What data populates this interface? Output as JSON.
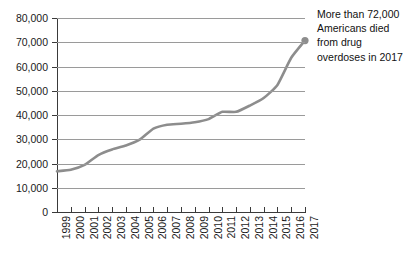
{
  "chart_data": {
    "type": "line",
    "title": "",
    "subtitle": "",
    "xlabel": "",
    "ylabel": "",
    "ylim": [
      0,
      80000
    ],
    "ytick_labels": [
      "80,000",
      "70,000",
      "60,000",
      "50,000",
      "40,000",
      "30,000",
      "20,000",
      "10,000",
      "0"
    ],
    "ytick_values": [
      80000,
      70000,
      60000,
      50000,
      40000,
      30000,
      20000,
      10000,
      0
    ],
    "grid": "horizontal",
    "legend": "none",
    "categories": [
      "1999",
      "2000",
      "2001",
      "2002",
      "2003",
      "2004",
      "2005",
      "2006",
      "2007",
      "2008",
      "2009",
      "2010",
      "2011",
      "2012",
      "2013",
      "2014",
      "2015",
      "2016",
      "2017"
    ],
    "series": [
      {
        "name": "Drug overdose deaths",
        "color": "#8d8d8d",
        "values": [
          16800,
          17400,
          19400,
          23500,
          25800,
          27400,
          29800,
          34400,
          36000,
          36400,
          37000,
          38300,
          41300,
          41300,
          43900,
          47000,
          52400,
          63600,
          70700
        ]
      }
    ],
    "marker": {
      "name": "endpoint-marker",
      "x": "2017",
      "y": 70700,
      "color": "#8d8d8d"
    },
    "annotations": [
      {
        "name": "overdose-callout",
        "text": "More than 72,000 Americans died from drug overdoses in 2017"
      }
    ]
  }
}
